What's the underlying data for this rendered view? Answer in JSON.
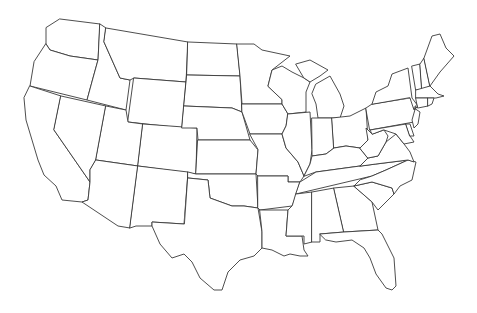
{
  "map": {
    "type": "outline",
    "region": "Contiguous United States",
    "labels_visible": false,
    "colors": {
      "background": "#ffffff",
      "stroke": "#3a3a3a",
      "fill": "#ffffff"
    },
    "states": [
      {
        "id": "WA",
        "name": "Washington",
        "d": "M60,19 L100,24 L98,60 L70,56 L50,50 L46,44 L46,28 Z"
      },
      {
        "id": "OR",
        "name": "Oregon",
        "d": "M46,44 L50,50 L70,56 L98,60 L93,78 L87,100 L30,86 L34,62 Z"
      },
      {
        "id": "CA",
        "name": "California",
        "d": "M30,86 L61,96 L54,130 L90,182 L88,200 L82,202 L62,200 L56,186 L44,175 L38,160 L32,140 L26,120 L24,98 Z"
      },
      {
        "id": "ID",
        "name": "Idaho",
        "d": "M100,24 L106,28 L104,42 L112,60 L120,78 L130,80 L126,110 L87,100 L93,78 L98,60 Z"
      },
      {
        "id": "NV",
        "name": "Nevada",
        "d": "M61,96 L106,106 L96,160 L90,170 L90,182 L54,130 Z"
      },
      {
        "id": "MT",
        "name": "Montana",
        "d": "M106,28 L188,42 L186,82 L134,78 L130,80 L120,78 L112,60 L104,42 Z"
      },
      {
        "id": "WY",
        "name": "Wyoming",
        "d": "M134,78 L186,82 L182,128 L128,122 Z"
      },
      {
        "id": "UT",
        "name": "Utah",
        "d": "M106,106 L126,110 L128,122 L143,124 L138,166 L96,160 Z"
      },
      {
        "id": "AZ",
        "name": "Arizona",
        "d": "M96,160 L138,166 L130,228 L118,226 L82,202 L88,200 L90,182 L90,170 Z"
      },
      {
        "id": "CO",
        "name": "Colorado",
        "d": "M143,124 L197,128 L196,174 L138,166 Z"
      },
      {
        "id": "NM",
        "name": "New Mexico",
        "d": "M138,166 L188,172 L184,224 L152,222 L152,226 L136,226 L130,228 Z"
      },
      {
        "id": "ND",
        "name": "North Dakota",
        "d": "M188,42 L237,44 L240,76 L187,75 Z"
      },
      {
        "id": "SD",
        "name": "South Dakota",
        "d": "M187,75 L240,76 L242,112 L232,108 L184,106 Z"
      },
      {
        "id": "NE",
        "name": "Nebraska",
        "d": "M184,106 L232,108 L242,112 L250,140 L198,140 L197,128 L182,128 Z"
      },
      {
        "id": "KS",
        "name": "Kansas",
        "d": "M198,140 L250,140 L258,150 L256,174 L196,174 Z"
      },
      {
        "id": "OK",
        "name": "Oklahoma",
        "d": "M188,172 L196,174 L256,174 L258,208 L244,206 L232,206 L210,198 L208,180 L188,178 Z"
      },
      {
        "id": "TX",
        "name": "Texas",
        "d": "M188,178 L208,180 L210,198 L232,206 L244,206 L258,208 L262,232 L262,248 L254,256 L240,260 L228,272 L222,290 L214,290 L200,278 L192,262 L184,254 L172,258 L160,244 L152,226 L152,222 L184,224 Z"
      },
      {
        "id": "MN",
        "name": "Minnesota",
        "d": "M237,44 L254,44 L262,50 L290,56 L272,70 L268,86 L282,100 L282,104 L242,104 L240,76 Z"
      },
      {
        "id": "IA",
        "name": "Iowa",
        "d": "M242,104 L282,104 L288,114 L286,126 L282,134 L250,134 L242,112 Z"
      },
      {
        "id": "MO",
        "name": "Missouri",
        "d": "M250,134 L282,134 L286,148 L298,162 L304,176 L300,182 L288,182 L288,176 L258,176 L256,174 L258,150 Z"
      },
      {
        "id": "AR",
        "name": "Arkansas",
        "d": "M258,176 L288,176 L288,182 L300,182 L296,196 L292,206 L260,210 L258,208 Z"
      },
      {
        "id": "LA",
        "name": "Louisiana",
        "d": "M260,210 L288,210 L286,236 L302,236 L304,250 L308,256 L300,256 L290,254 L284,256 L272,250 L262,248 L262,232 Z"
      },
      {
        "id": "WI",
        "name": "Wisconsin",
        "d": "M268,86 L272,70 L282,66 L292,72 L304,78 L310,82 L306,92 L306,112 L288,114 L282,104 L282,100 Z"
      },
      {
        "id": "IL",
        "name": "Illinois",
        "d": "M288,114 L310,112 L312,150 L310,164 L304,176 L298,162 L286,148 L282,134 L286,126 Z"
      },
      {
        "id": "MI",
        "name": "Michigan",
        "d": "M296,64 L310,60 L328,70 L320,76 L310,82 L304,78 Z M316,84 L330,76 L340,94 L344,106 L340,118 L318,118 L316,104 L312,94 Z"
      },
      {
        "id": "IN",
        "name": "Indiana",
        "d": "M312,118 L332,118 L334,148 L326,154 L312,156 L312,150 Z"
      },
      {
        "id": "OH",
        "name": "Ohio",
        "d": "M332,118 L350,116 L366,108 L368,140 L360,148 L346,146 L334,148 Z"
      },
      {
        "id": "KY",
        "name": "Kentucky",
        "d": "M304,176 L310,164 L312,156 L326,154 L334,148 L346,146 L360,148 L368,158 L360,166 L316,172 Z"
      },
      {
        "id": "TN",
        "name": "Tennessee",
        "d": "M300,182 L316,172 L360,166 L376,164 L408,160 L386,170 L372,176 L296,194 Z"
      },
      {
        "id": "MS",
        "name": "Mississippi",
        "d": "M296,194 L312,192 L312,242 L304,244 L304,236 L286,236 L288,210 L292,206 Z"
      },
      {
        "id": "AL",
        "name": "Alabama",
        "d": "M312,192 L334,188 L344,232 L320,234 L320,242 L312,242 Z"
      },
      {
        "id": "GA",
        "name": "Georgia",
        "d": "M334,188 L354,186 L372,202 L378,230 L344,232 Z"
      },
      {
        "id": "FL",
        "name": "Florida",
        "d": "M320,234 L344,232 L378,230 L382,234 L394,258 L396,286 L392,290 L386,288 L376,274 L370,258 L364,248 L352,240 L336,242 L326,240 Z"
      },
      {
        "id": "SC",
        "name": "South Carolina",
        "d": "M354,186 L372,182 L392,188 L394,194 L378,210 L372,202 Z"
      },
      {
        "id": "NC",
        "name": "North Carolina",
        "d": "M372,176 L386,170 L408,160 L416,162 L412,180 L400,186 L394,194 L392,188 L372,182 L354,186 L360,180 Z"
      },
      {
        "id": "VA",
        "name": "Virginia",
        "d": "M360,166 L368,158 L378,156 L386,142 L396,134 L404,144 L410,152 L414,162 L408,160 L376,164 Z"
      },
      {
        "id": "WV",
        "name": "West Virginia",
        "d": "M360,148 L368,140 L366,128 L372,134 L384,130 L388,136 L386,142 L378,156 L368,158 Z"
      },
      {
        "id": "PA",
        "name": "Pennsylvania",
        "d": "M366,108 L372,104 L410,98 L416,106 L414,122 L370,130 Z"
      },
      {
        "id": "NY",
        "name": "New York",
        "d": "M372,104 L376,92 L388,86 L392,74 L408,68 L412,98 L418,106 L414,110 L410,98 Z"
      },
      {
        "id": "MD",
        "name": "Maryland",
        "d": "M372,134 L370,130 L406,124 L410,136 L414,142 L404,144 L396,134 L384,130 Z"
      },
      {
        "id": "DE",
        "name": "Delaware",
        "d": "M406,124 L410,124 L414,136 L410,136 Z"
      },
      {
        "id": "NJ",
        "name": "New Jersey",
        "d": "M414,108 L420,112 L418,124 L414,128 L412,120 L416,106 Z"
      },
      {
        "id": "VT",
        "name": "Vermont",
        "d": "M412,66 L420,64 L422,90 L416,90 Z"
      },
      {
        "id": "NH",
        "name": "New Hampshire",
        "d": "M420,64 L424,58 L430,86 L422,90 Z"
      },
      {
        "id": "ME",
        "name": "Maine",
        "d": "M424,58 L432,36 L440,34 L446,48 L454,56 L440,72 L430,86 Z"
      },
      {
        "id": "MA",
        "name": "Massachusetts",
        "d": "M416,90 L430,86 L438,94 L444,96 L436,98 L416,98 Z"
      },
      {
        "id": "CT",
        "name": "Connecticut",
        "d": "M416,98 L428,98 L428,106 L418,108 Z"
      },
      {
        "id": "RI",
        "name": "Rhode Island",
        "d": "M428,98 L434,98 L432,104 L428,106 Z"
      }
    ]
  }
}
